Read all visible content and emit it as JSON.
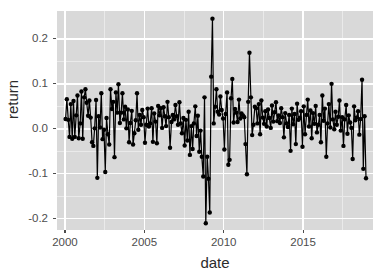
{
  "chart_data": {
    "type": "line",
    "title": "",
    "subtitle": "",
    "xlabel": "date",
    "ylabel": "return",
    "xlim": [
      1999.5,
      2019.4
    ],
    "ylim": [
      -0.225,
      0.262
    ],
    "grid": true,
    "legend": null,
    "x_ticks": [
      2000,
      2005,
      2010,
      2015
    ],
    "x_tick_labels": [
      "2000",
      "2005",
      "2010",
      "2015"
    ],
    "x_minor_ticks": [
      2002.5,
      2007.5,
      2012.5,
      2017.5
    ],
    "y_ticks": [
      0.2,
      0.1,
      0.0,
      -0.1,
      -0.2
    ],
    "y_tick_labels": [
      "0.2",
      "0.1",
      "0.0",
      "-0.1",
      "-0.2"
    ],
    "y_minor_ticks": [
      0.15,
      0.05,
      -0.05,
      -0.15
    ],
    "marker": "filled-circle",
    "marker_color": "#000000",
    "line_color": "#000000",
    "panel_background": "#d9d9d9",
    "grid_color": "#ffffff",
    "series": [
      {
        "name": "return",
        "x": [
          2000.04,
          2000.12,
          2000.21,
          2000.29,
          2000.37,
          2000.46,
          2000.54,
          2000.62,
          2000.71,
          2000.79,
          2000.87,
          2000.96,
          2001.04,
          2001.12,
          2001.21,
          2001.29,
          2001.37,
          2001.46,
          2001.54,
          2001.62,
          2001.71,
          2001.79,
          2001.87,
          2001.96,
          2002.04,
          2002.12,
          2002.21,
          2002.29,
          2002.37,
          2002.46,
          2002.54,
          2002.62,
          2002.71,
          2002.79,
          2002.87,
          2002.96,
          2003.04,
          2003.12,
          2003.21,
          2003.29,
          2003.37,
          2003.46,
          2003.54,
          2003.62,
          2003.71,
          2003.79,
          2003.87,
          2003.96,
          2004.04,
          2004.12,
          2004.21,
          2004.29,
          2004.37,
          2004.46,
          2004.54,
          2004.62,
          2004.71,
          2004.79,
          2004.87,
          2004.96,
          2005.04,
          2005.12,
          2005.21,
          2005.29,
          2005.37,
          2005.46,
          2005.54,
          2005.62,
          2005.71,
          2005.79,
          2005.87,
          2005.96,
          2006.04,
          2006.12,
          2006.21,
          2006.29,
          2006.37,
          2006.46,
          2006.54,
          2006.62,
          2006.71,
          2006.79,
          2006.87,
          2006.96,
          2007.04,
          2007.12,
          2007.21,
          2007.29,
          2007.37,
          2007.46,
          2007.54,
          2007.62,
          2007.71,
          2007.79,
          2007.87,
          2007.96,
          2008.04,
          2008.12,
          2008.21,
          2008.29,
          2008.37,
          2008.46,
          2008.54,
          2008.62,
          2008.71,
          2008.79,
          2008.87,
          2008.96,
          2009.04,
          2009.12,
          2009.21,
          2009.29,
          2009.37,
          2009.46,
          2009.54,
          2009.62,
          2009.71,
          2009.79,
          2009.87,
          2009.96,
          2010.04,
          2010.12,
          2010.21,
          2010.29,
          2010.37,
          2010.46,
          2010.54,
          2010.62,
          2010.71,
          2010.79,
          2010.87,
          2010.96,
          2011.04,
          2011.12,
          2011.21,
          2011.29,
          2011.37,
          2011.46,
          2011.54,
          2011.62,
          2011.71,
          2011.79,
          2011.87,
          2011.96,
          2012.04,
          2012.12,
          2012.21,
          2012.29,
          2012.37,
          2012.46,
          2012.54,
          2012.62,
          2012.71,
          2012.79,
          2012.87,
          2012.96,
          2013.04,
          2013.12,
          2013.21,
          2013.29,
          2013.37,
          2013.46,
          2013.54,
          2013.62,
          2013.71,
          2013.79,
          2013.87,
          2013.96,
          2014.04,
          2014.12,
          2014.21,
          2014.29,
          2014.37,
          2014.46,
          2014.54,
          2014.62,
          2014.71,
          2014.79,
          2014.87,
          2014.96,
          2015.04,
          2015.12,
          2015.21,
          2015.29,
          2015.37,
          2015.46,
          2015.54,
          2015.62,
          2015.71,
          2015.79,
          2015.87,
          2015.96,
          2016.04,
          2016.12,
          2016.21,
          2016.29,
          2016.37,
          2016.46,
          2016.54,
          2016.62,
          2016.71,
          2016.79,
          2016.87,
          2016.96,
          2017.04,
          2017.12,
          2017.21,
          2017.29,
          2017.37,
          2017.46,
          2017.54,
          2017.62,
          2017.71,
          2017.79,
          2017.87,
          2017.96,
          2018.04,
          2018.12,
          2018.21,
          2018.29,
          2018.37,
          2018.46,
          2018.54,
          2018.62,
          2018.71,
          2018.79,
          2018.87,
          2018.96
        ],
        "y": [
          0.022,
          0.066,
          0.02,
          -0.018,
          0.055,
          -0.022,
          0.062,
          -0.018,
          0.03,
          0.074,
          -0.021,
          0.012,
          0.083,
          -0.022,
          0.07,
          0.088,
          0.058,
          0.029,
          0.063,
          0.025,
          -0.03,
          -0.038,
          0.001,
          0.064,
          -0.109,
          0.028,
          0.003,
          0.079,
          -0.023,
          -0.002,
          -0.096,
          0.024,
          -0.012,
          -0.035,
          0.088,
          0.044,
          0.06,
          -0.063,
          0.081,
          0.036,
          0.099,
          0.013,
          0.036,
          0.079,
          0.021,
          0.049,
          0.001,
          0.043,
          -0.03,
          0.013,
          0.04,
          -0.035,
          -0.01,
          0.019,
          0.079,
          -0.002,
          0.031,
          0.009,
          0.042,
          0.026,
          -0.031,
          0.009,
          0.045,
          0.005,
          0.012,
          0.046,
          -0.029,
          0.034,
          0.016,
          -0.032,
          0.051,
          0.03,
          0.046,
          0.002,
          0.048,
          0.028,
          0.006,
          0.06,
          0.026,
          -0.042,
          0.015,
          0.031,
          0.021,
          0.053,
          0.028,
          0.009,
          0.059,
          0.012,
          -0.01,
          0.024,
          -0.037,
          0.02,
          -0.026,
          0.038,
          -0.058,
          0.006,
          -0.045,
          0.012,
          0.05,
          -0.016,
          0.029,
          -0.051,
          -0.004,
          -0.062,
          -0.106,
          0.07,
          -0.21,
          -0.062,
          -0.111,
          -0.186,
          0.116,
          0.245,
          0.012,
          0.049,
          0.088,
          0.038,
          0.032,
          0.072,
          0.042,
          0.023,
          -0.046,
          0.033,
          0.081,
          -0.08,
          -0.069,
          0.068,
          0.111,
          0.014,
          0.044,
          0.036,
          0.015,
          0.065,
          0.023,
          0.034,
          0.03,
          0.026,
          -0.034,
          -0.101,
          0.06,
          0.169,
          0.07,
          -0.014,
          0.009,
          0.049,
          0.046,
          0.012,
          0.055,
          -0.012,
          0.063,
          0.025,
          0.011,
          0.039,
          0.005,
          0.043,
          0.024,
          0.002,
          0.052,
          0.016,
          0.037,
          0.059,
          0.017,
          0.03,
          0.013,
          0.046,
          0.026,
          -0.019,
          0.035,
          0.012,
          0.004,
          0.031,
          -0.049,
          0.045,
          0.01,
          0.033,
          -0.034,
          0.056,
          0.02,
          0.024,
          0.039,
          -0.04,
          0.05,
          -0.012,
          0.031,
          0.065,
          0.005,
          0.041,
          -0.021,
          0.035,
          0.011,
          0.051,
          -0.008,
          0.009,
          0.031,
          -0.03,
          0.074,
          0.018,
          0.045,
          -0.062,
          0.012,
          0.055,
          0.003,
          0.1,
          0.021,
          -0.001,
          0.038,
          0.009,
          0.027,
          0.063,
          -0.004,
          0.026,
          -0.038,
          0.021,
          0.053,
          -0.011,
          0.03,
          0.014,
          0.002,
          -0.067,
          0.05,
          0.019,
          0.025,
          0.039,
          -0.013,
          0.022,
          0.109,
          -0.089,
          0.028,
          -0.11
        ]
      }
    ]
  },
  "axes": {
    "y_title": "return",
    "x_title": "date"
  }
}
